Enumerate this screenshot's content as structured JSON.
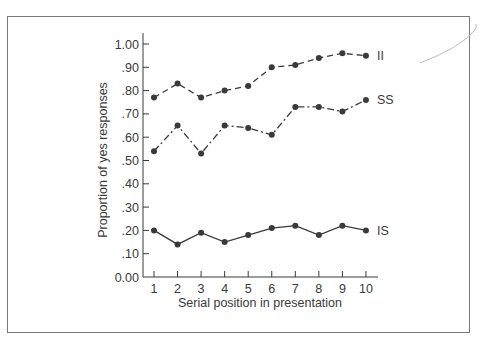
{
  "chart_data": {
    "type": "line",
    "title": "",
    "xlabel": "Serial position in presentation",
    "ylabel": "Proportion of yes responses",
    "x": [
      1,
      2,
      3,
      4,
      5,
      6,
      7,
      8,
      9,
      10
    ],
    "yticks": [
      "0.00",
      ".10",
      ".20",
      ".30",
      ".40",
      ".50",
      ".60",
      ".70",
      ".80",
      ".90",
      "1.00"
    ],
    "ylim": [
      0,
      1
    ],
    "grid": false,
    "legend": "inline labels at line ends",
    "series": [
      {
        "name": "II",
        "style": "dashed",
        "values": [
          0.77,
          0.83,
          0.77,
          0.8,
          0.82,
          0.9,
          0.91,
          0.94,
          0.96,
          0.95
        ]
      },
      {
        "name": "SS",
        "style": "dash-dot",
        "values": [
          0.54,
          0.65,
          0.53,
          0.65,
          0.64,
          0.61,
          0.73,
          0.73,
          0.71,
          0.76
        ]
      },
      {
        "name": "IS",
        "style": "solid",
        "values": [
          0.2,
          0.14,
          0.19,
          0.15,
          0.18,
          0.21,
          0.22,
          0.18,
          0.22,
          0.2
        ]
      }
    ]
  },
  "colors": {
    "line": "#3a3a3a",
    "frame": "#7a7a7a"
  }
}
